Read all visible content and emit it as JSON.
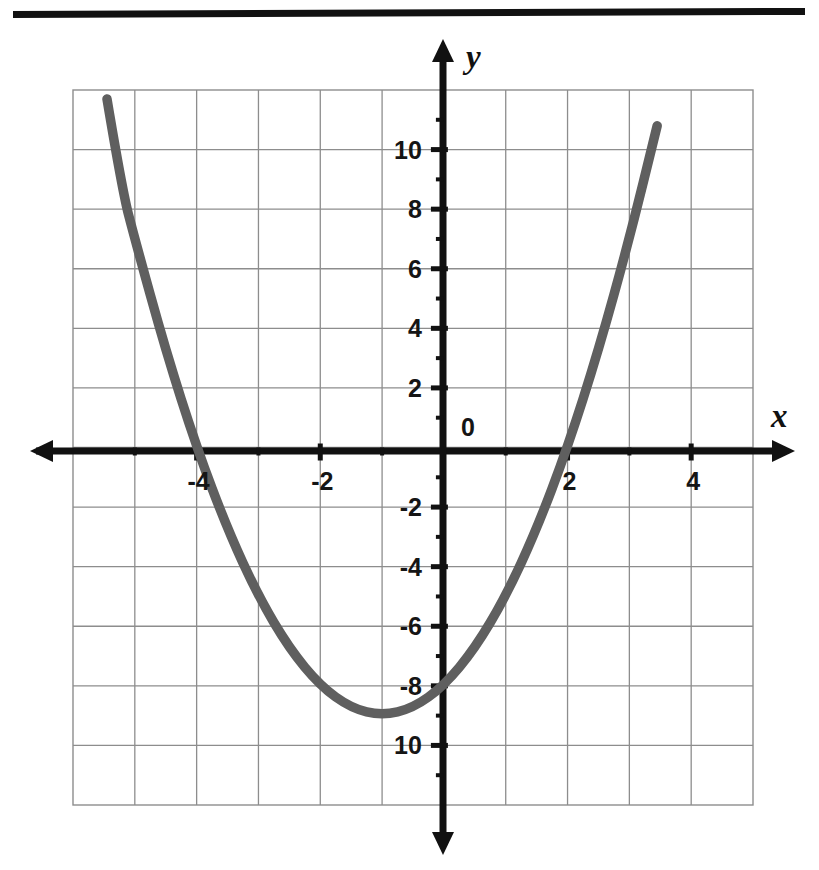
{
  "page": {
    "background_color": "#ffffff",
    "top_rule": {
      "name": "horizontal-rule",
      "color": "#111111"
    }
  },
  "chart_data": {
    "type": "line",
    "subtype": "parabola-graph",
    "title": "",
    "subtitle": "",
    "xlabel": "x",
    "ylabel": "y",
    "equation": "y = x^2 + 2x - 8",
    "factored": "y = (x + 4)(x - 2)",
    "vertex": {
      "x": -1,
      "y": -9
    },
    "roots": [
      -4,
      2
    ],
    "y_intercept": -8,
    "xlim": [
      -6,
      5
    ],
    "ylim": [
      -12,
      12
    ],
    "x_ticks_major": [
      -4,
      -2,
      2,
      4
    ],
    "x_tick_labels": [
      "-4",
      "-2",
      "2",
      "4"
    ],
    "y_ticks_major": [
      10,
      8,
      6,
      4,
      2,
      -2,
      -4,
      -6,
      -8,
      -10
    ],
    "y_tick_labels": [
      "10",
      "8",
      "6",
      "4",
      "2",
      "-2",
      "-4",
      "-6",
      "-8",
      "10"
    ],
    "origin_label": "0",
    "grid": true,
    "grid_x_step": 1,
    "grid_y_step": 2,
    "legend": null,
    "legend_position": "none",
    "curve_color": "#5f5f5f",
    "curve_width_px": 9,
    "axis_color": "#111111",
    "grid_color": "#8d8d8d",
    "points": [
      {
        "x": -5.45,
        "y": 11.7
      },
      {
        "x": -5.2,
        "y": 8.6
      },
      {
        "x": -5,
        "y": 7
      },
      {
        "x": -4.5,
        "y": 3.25
      },
      {
        "x": -4,
        "y": 0
      },
      {
        "x": -3.5,
        "y": -2.75
      },
      {
        "x": -3,
        "y": -5
      },
      {
        "x": -2.5,
        "y": -6.75
      },
      {
        "x": -2,
        "y": -8
      },
      {
        "x": -1.5,
        "y": -8.75
      },
      {
        "x": -1,
        "y": -9
      },
      {
        "x": -0.5,
        "y": -8.75
      },
      {
        "x": 0,
        "y": -8
      },
      {
        "x": 0.5,
        "y": -6.75
      },
      {
        "x": 1,
        "y": -5
      },
      {
        "x": 1.5,
        "y": -2.75
      },
      {
        "x": 2,
        "y": 0
      },
      {
        "x": 2.5,
        "y": 3.25
      },
      {
        "x": 3,
        "y": 7
      },
      {
        "x": 3.45,
        "y": 10.8
      }
    ]
  }
}
